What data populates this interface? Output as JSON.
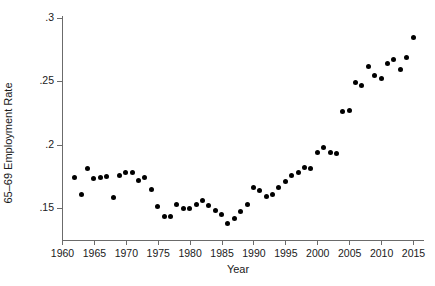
{
  "chart_data": {
    "type": "scatter",
    "title": "",
    "xlabel": "Year",
    "ylabel": "65–69 Employment Rate",
    "xlim": [
      1959,
      2017
    ],
    "ylim": [
      0.132,
      0.305
    ],
    "xticks": [
      1960,
      1965,
      1970,
      1975,
      1980,
      1985,
      1990,
      1995,
      2000,
      2005,
      2010,
      2015
    ],
    "xtick_labels": [
      "1960",
      "1965",
      "1970",
      "1975",
      "1980",
      "1985",
      "1990",
      "1995",
      "2000",
      "2005",
      "2010",
      "2015"
    ],
    "yticks": [
      0.15,
      0.2,
      0.25,
      0.3
    ],
    "ytick_labels": [
      ".15",
      ".2",
      ".25",
      ".3"
    ],
    "grid": false,
    "legend": null,
    "marker": "filled-circle",
    "marker_color": "#000000",
    "x": [
      1962,
      1963,
      1964,
      1965,
      1966,
      1967,
      1968,
      1969,
      1970,
      1971,
      1972,
      1973,
      1974,
      1975,
      1976,
      1977,
      1978,
      1979,
      1980,
      1981,
      1982,
      1983,
      1984,
      1985,
      1986,
      1987,
      1988,
      1989,
      1990,
      1991,
      1992,
      1993,
      1994,
      1995,
      1996,
      1997,
      1998,
      1999,
      2000,
      2001,
      2002,
      2003,
      2004,
      2005,
      2006,
      2007,
      2008,
      2009,
      2010,
      2011,
      2012,
      2013,
      2014,
      2015
    ],
    "y": [
      0.174,
      0.161,
      0.181,
      0.173,
      0.174,
      0.175,
      0.158,
      0.176,
      0.178,
      0.178,
      0.172,
      0.174,
      0.165,
      0.151,
      0.143,
      0.143,
      0.153,
      0.15,
      0.15,
      0.153,
      0.156,
      0.152,
      0.148,
      0.145,
      0.138,
      0.142,
      0.147,
      0.153,
      0.166,
      0.164,
      0.159,
      0.161,
      0.166,
      0.171,
      0.176,
      0.178,
      0.182,
      0.181,
      0.194,
      0.198,
      0.194,
      0.193,
      0.226,
      0.227,
      0.249,
      0.247,
      0.262,
      0.255,
      0.252,
      0.264,
      0.267,
      0.259,
      0.269,
      0.285
    ]
  }
}
